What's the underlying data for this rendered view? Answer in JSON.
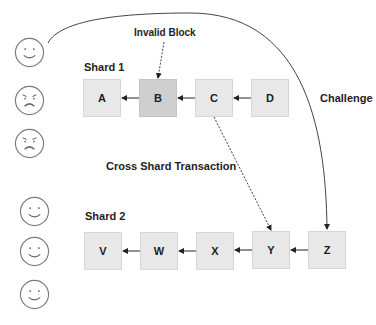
{
  "labels": {
    "invalid_block": "Invalid Block",
    "challenge": "Challenge",
    "cross_shard": "Cross Shard Transaction"
  },
  "shards": [
    {
      "label": "Shard 1",
      "blocks": [
        {
          "id": "A",
          "state": "normal"
        },
        {
          "id": "B",
          "state": "invalid"
        },
        {
          "id": "C",
          "state": "normal"
        },
        {
          "id": "D",
          "state": "normal"
        }
      ]
    },
    {
      "label": "Shard 2",
      "blocks": [
        {
          "id": "V",
          "state": "normal"
        },
        {
          "id": "W",
          "state": "normal"
        },
        {
          "id": "X",
          "state": "normal"
        },
        {
          "id": "Y",
          "state": "normal"
        },
        {
          "id": "Z",
          "state": "normal"
        }
      ]
    }
  ],
  "validators": {
    "shard1": [
      "happy",
      "angry",
      "angry"
    ],
    "shard2": [
      "happy",
      "happy",
      "happy"
    ]
  },
  "colors": {
    "block_fill": "#e8e8e8",
    "invalid_block_fill": "#cfcfcf",
    "line": "#333333",
    "face_stroke": "#7a7a7a"
  }
}
